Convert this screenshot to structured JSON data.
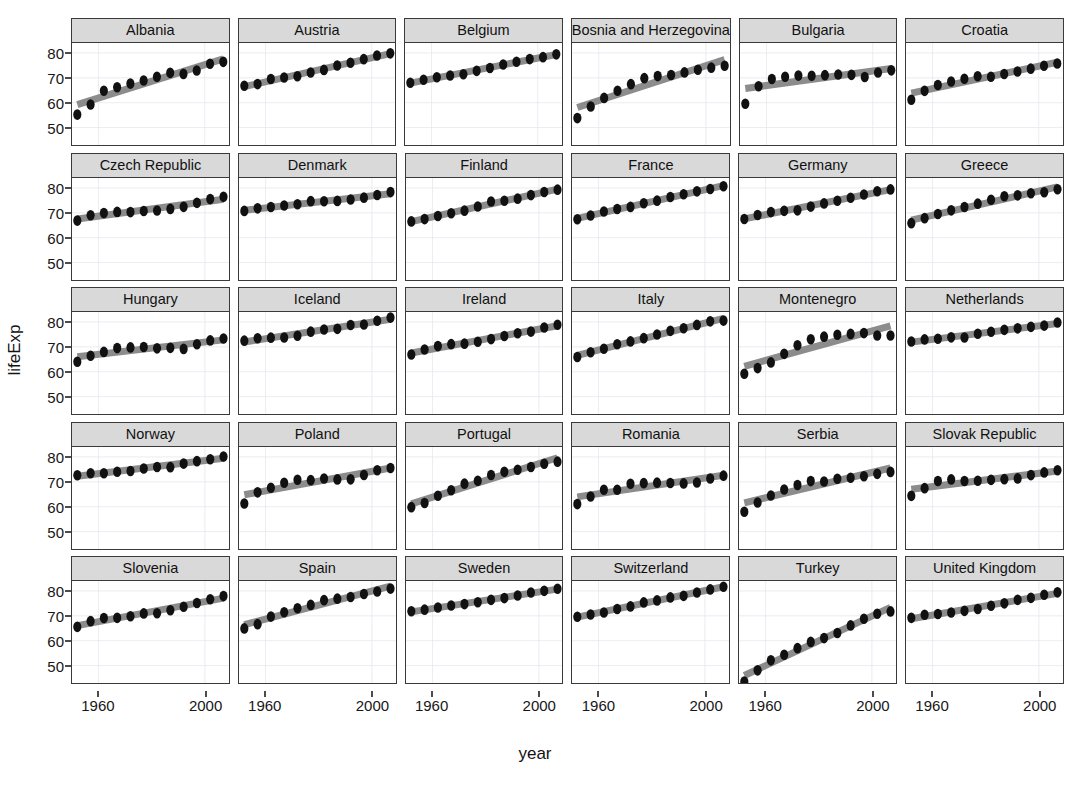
{
  "chart_data": {
    "type": "scatter",
    "title": "",
    "xlabel": "year",
    "ylabel": "lifeExp",
    "xlim": [
      1950,
      2009
    ],
    "ylim": [
      43,
      84
    ],
    "xticks": [
      1960,
      2000
    ],
    "yticks": [
      50,
      60,
      70,
      80
    ],
    "grid": true,
    "legend": "none",
    "facet_rows": 5,
    "facet_cols": 6,
    "point_color": "#111111",
    "trend_color": "#8c8c8c",
    "strip_color": "#d9d9d9",
    "panel_border_color": "#3a3a3a",
    "x": [
      1952,
      1957,
      1962,
      1967,
      1972,
      1977,
      1982,
      1987,
      1992,
      1997,
      2002,
      2007
    ],
    "facets": [
      {
        "label": "Albania",
        "values": [
          55.23,
          59.28,
          64.82,
          66.22,
          67.69,
          68.93,
          70.42,
          72.0,
          71.58,
          72.95,
          75.65,
          76.42
        ]
      },
      {
        "label": "Austria",
        "values": [
          66.8,
          67.48,
          69.54,
          70.14,
          70.63,
          72.17,
          73.18,
          74.94,
          76.04,
          77.51,
          78.98,
          79.83
        ]
      },
      {
        "label": "Belgium",
        "values": [
          68.0,
          69.24,
          70.25,
          70.94,
          71.44,
          72.8,
          73.93,
          75.35,
          76.46,
          77.53,
          78.32,
          79.44
        ]
      },
      {
        "label": "Bosnia and Herzegovina",
        "values": [
          53.82,
          58.45,
          61.93,
          64.79,
          67.45,
          69.86,
          70.69,
          71.14,
          72.18,
          73.24,
          74.09,
          74.85
        ]
      },
      {
        "label": "Bulgaria",
        "values": [
          59.6,
          66.61,
          69.51,
          70.42,
          70.9,
          70.81,
          71.08,
          71.34,
          71.19,
          70.32,
          72.14,
          73.01
        ]
      },
      {
        "label": "Croatia",
        "values": [
          61.21,
          64.77,
          67.13,
          68.5,
          69.61,
          70.64,
          70.46,
          71.52,
          72.53,
          73.68,
          74.88,
          75.75
        ]
      },
      {
        "label": "Czech Republic",
        "values": [
          66.87,
          69.03,
          69.9,
          70.38,
          70.29,
          70.71,
          70.96,
          71.58,
          72.4,
          74.01,
          75.51,
          76.49
        ]
      },
      {
        "label": "Denmark",
        "values": [
          70.78,
          71.81,
          72.35,
          72.96,
          73.47,
          74.69,
          74.63,
          74.8,
          75.33,
          76.11,
          77.18,
          78.33
        ]
      },
      {
        "label": "Finland",
        "values": [
          66.55,
          67.49,
          68.75,
          69.83,
          70.87,
          72.52,
          74.55,
          74.83,
          75.7,
          77.13,
          78.37,
          79.31
        ]
      },
      {
        "label": "France",
        "values": [
          67.41,
          68.93,
          70.51,
          71.55,
          72.38,
          73.83,
          74.89,
          76.34,
          77.46,
          78.64,
          79.59,
          80.66
        ]
      },
      {
        "label": "Germany",
        "values": [
          67.5,
          69.1,
          70.3,
          70.8,
          71.0,
          72.5,
          73.8,
          74.85,
          76.07,
          77.34,
          78.67,
          79.41
        ]
      },
      {
        "label": "Greece",
        "values": [
          65.86,
          67.86,
          69.51,
          71.0,
          72.34,
          73.68,
          75.24,
          76.67,
          77.03,
          77.87,
          78.26,
          79.48
        ]
      },
      {
        "label": "Hungary",
        "values": [
          64.03,
          66.41,
          67.96,
          69.5,
          69.76,
          69.95,
          69.39,
          69.58,
          69.17,
          71.04,
          72.59,
          73.34
        ]
      },
      {
        "label": "Iceland",
        "values": [
          72.49,
          73.47,
          73.68,
          73.73,
          74.46,
          76.11,
          76.99,
          77.23,
          78.77,
          78.95,
          80.5,
          81.76
        ]
      },
      {
        "label": "Ireland",
        "values": [
          66.91,
          68.9,
          70.29,
          71.08,
          71.28,
          72.03,
          73.1,
          74.36,
          75.47,
          76.12,
          77.78,
          78.89
        ]
      },
      {
        "label": "Italy",
        "values": [
          65.94,
          67.81,
          69.24,
          71.06,
          72.19,
          73.48,
          74.98,
          76.42,
          77.44,
          78.82,
          80.24,
          80.55
        ]
      },
      {
        "label": "Montenegro",
        "values": [
          59.16,
          61.45,
          63.73,
          67.18,
          70.64,
          73.07,
          74.1,
          74.86,
          75.19,
          75.51,
          74.54,
          74.54
        ]
      },
      {
        "label": "Netherlands",
        "values": [
          72.13,
          72.99,
          73.23,
          73.82,
          73.75,
          75.24,
          76.05,
          76.83,
          77.42,
          78.03,
          78.53,
          79.76
        ]
      },
      {
        "label": "Norway",
        "values": [
          72.67,
          73.44,
          73.47,
          74.08,
          74.34,
          75.37,
          75.97,
          75.89,
          77.32,
          78.32,
          79.05,
          80.2
        ]
      },
      {
        "label": "Poland",
        "values": [
          61.31,
          65.77,
          67.64,
          69.61,
          70.85,
          70.67,
          71.32,
          70.98,
          70.99,
          72.75,
          74.67,
          75.56
        ]
      },
      {
        "label": "Portugal",
        "values": [
          59.82,
          61.51,
          64.39,
          66.6,
          69.26,
          70.41,
          72.77,
          74.06,
          74.86,
          75.97,
          77.29,
          78.1
        ]
      },
      {
        "label": "Romania",
        "values": [
          61.05,
          64.1,
          66.8,
          66.8,
          69.21,
          69.46,
          69.66,
          69.53,
          69.36,
          69.72,
          71.32,
          72.48
        ]
      },
      {
        "label": "Serbia",
        "values": [
          57.99,
          61.68,
          64.53,
          66.91,
          68.7,
          70.3,
          70.16,
          71.22,
          71.66,
          72.23,
          73.21,
          74.0
        ]
      },
      {
        "label": "Slovak Republic",
        "values": [
          64.36,
          67.45,
          70.33,
          70.98,
          70.35,
          70.45,
          70.8,
          71.08,
          71.38,
          72.71,
          73.8,
          74.66
        ]
      },
      {
        "label": "Slovenia",
        "values": [
          65.57,
          67.85,
          69.15,
          69.18,
          69.82,
          70.97,
          71.06,
          72.25,
          73.64,
          75.13,
          76.66,
          77.93
        ]
      },
      {
        "label": "Spain",
        "values": [
          64.94,
          66.66,
          69.69,
          71.44,
          73.06,
          74.39,
          76.3,
          76.9,
          77.57,
          78.77,
          79.78,
          80.94
        ]
      },
      {
        "label": "Sweden",
        "values": [
          71.86,
          72.49,
          73.37,
          74.16,
          74.72,
          75.44,
          76.42,
          77.13,
          78.16,
          79.39,
          80.04,
          80.88
        ]
      },
      {
        "label": "Switzerland",
        "values": [
          69.62,
          70.56,
          71.32,
          72.77,
          73.78,
          75.39,
          76.21,
          77.41,
          78.03,
          79.37,
          80.62,
          81.7
        ]
      },
      {
        "label": "Turkey",
        "values": [
          43.58,
          48.08,
          52.1,
          54.34,
          57.01,
          59.51,
          61.04,
          63.11,
          66.15,
          68.84,
          70.85,
          71.78
        ]
      },
      {
        "label": "United Kingdom",
        "values": [
          69.18,
          70.42,
          70.76,
          71.36,
          72.01,
          72.76,
          74.04,
          75.01,
          76.42,
          77.22,
          78.47,
          79.43
        ]
      }
    ]
  },
  "axis": {
    "ylabel": "lifeExp",
    "xlabel": "year",
    "yticks": [
      "80",
      "70",
      "60",
      "50"
    ],
    "xticks": [
      "1960",
      "2000"
    ]
  }
}
